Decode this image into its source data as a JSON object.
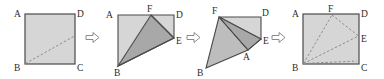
{
  "figure": {
    "type": "paper-folding-sequence",
    "background_color": "#ffffff",
    "outline_color": "#4a4a4a",
    "fill_light": "#d6d6d6",
    "fill_medium": "#bdbdbd",
    "fill_dark": "#a8a8a8",
    "crease_color": "#8c8c8c",
    "label_color": "#2b2b2b",
    "arrow_color": "#8a8a8a",
    "arrow_glyph": "rightwards-white-arrow"
  },
  "panels": [
    {
      "id": "panel-1",
      "name": "original-square",
      "caption": "",
      "labels": [
        {
          "text": "A",
          "x": 18,
          "y": 18,
          "corner": "top-left"
        },
        {
          "text": "D",
          "x": 79,
          "y": 18,
          "corner": "top-right"
        },
        {
          "text": "B",
          "x": 18,
          "y": 71,
          "corner": "bottom-left"
        },
        {
          "text": "C",
          "x": 79,
          "y": 71,
          "corner": "bottom-right"
        }
      ],
      "shape": {
        "kind": "square",
        "x": 25,
        "y": 14,
        "w": 50,
        "h": 50
      },
      "creases": [
        {
          "from": "B",
          "to": "E",
          "x1": 25,
          "y1": 64,
          "x2": 75,
          "y2": 36,
          "style": "dashed"
        }
      ]
    },
    {
      "id": "panel-2",
      "name": "first-fold",
      "caption": "",
      "labels": [
        {
          "text": "A",
          "x": 110,
          "y": 18
        },
        {
          "text": "F",
          "x": 148,
          "y": 11
        },
        {
          "text": "D",
          "x": 175,
          "y": 18
        },
        {
          "text": "E",
          "x": 178,
          "y": 40
        },
        {
          "text": "B",
          "x": 117,
          "y": 76
        }
      ]
    },
    {
      "id": "panel-3",
      "name": "second-fold",
      "caption": "",
      "labels": [
        {
          "text": "F",
          "x": 213,
          "y": 15
        },
        {
          "text": "D",
          "x": 263,
          "y": 16
        },
        {
          "text": "E",
          "x": 265,
          "y": 37
        },
        {
          "text": "A",
          "x": 243,
          "y": 57
        },
        {
          "text": "B",
          "x": 199,
          "y": 72
        }
      ]
    },
    {
      "id": "panel-4",
      "name": "unfolded-with-creases",
      "caption": "",
      "labels": [
        {
          "text": "A",
          "x": 296,
          "y": 18
        },
        {
          "text": "F",
          "x": 330,
          "y": 11
        },
        {
          "text": "D",
          "x": 365,
          "y": 18
        },
        {
          "text": "E",
          "x": 368,
          "y": 39
        },
        {
          "text": "B",
          "x": 296,
          "y": 71
        },
        {
          "text": "C",
          "x": 365,
          "y": 71
        }
      ],
      "shape": {
        "kind": "square",
        "x": 303,
        "y": 14,
        "w": 56,
        "h": 50
      },
      "creases": [
        {
          "from": "B",
          "to": "F",
          "style": "dashed"
        },
        {
          "from": "F",
          "to": "E",
          "style": "dashed"
        },
        {
          "from": "B",
          "to": "E",
          "style": "dashed"
        },
        {
          "from": "B",
          "to": "C-edge",
          "style": "dashed"
        }
      ]
    }
  ],
  "arrows": [
    {
      "id": "arrow-1",
      "name": "step-arrow-1",
      "x": 86,
      "y": 33,
      "direction": "right"
    },
    {
      "id": "arrow-2",
      "name": "step-arrow-2",
      "x": 187,
      "y": 33,
      "direction": "right"
    },
    {
      "id": "arrow-3",
      "name": "step-arrow-3",
      "x": 272,
      "y": 33,
      "direction": "right"
    }
  ]
}
